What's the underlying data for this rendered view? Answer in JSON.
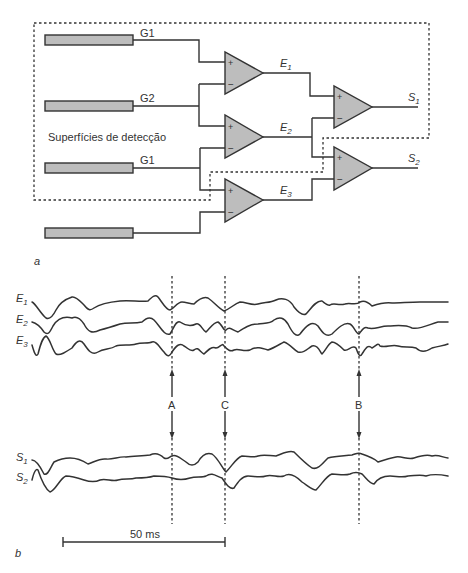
{
  "panel_a": {
    "label": "a",
    "box_label": "Superfícies de detecção",
    "electrodes": [
      {
        "label": "G1"
      },
      {
        "label": "G2"
      },
      {
        "label": "G1"
      },
      {
        "label": ""
      }
    ],
    "amplifiers": [
      {
        "output": "E",
        "sub": "1",
        "plus": "+",
        "minus": "−"
      },
      {
        "output": "E",
        "sub": "2",
        "plus": "+",
        "minus": "−"
      },
      {
        "output": "E",
        "sub": "3",
        "plus": "+",
        "minus": "−"
      },
      {
        "output": "S",
        "sub": "1",
        "plus": "+",
        "minus": "−"
      },
      {
        "output": "S",
        "sub": "2",
        "plus": "+",
        "minus": "−"
      }
    ],
    "colors": {
      "fill": "#bdbdbd",
      "stroke": "#333333"
    }
  },
  "panel_b": {
    "label": "b",
    "traces_top": [
      {
        "name": "E",
        "sub": "1"
      },
      {
        "name": "E",
        "sub": "2"
      },
      {
        "name": "E",
        "sub": "3"
      }
    ],
    "traces_bottom": [
      {
        "name": "S",
        "sub": "1"
      },
      {
        "name": "S",
        "sub": "2"
      }
    ],
    "markers": [
      {
        "label": "A"
      },
      {
        "label": "C"
      },
      {
        "label": "B"
      }
    ],
    "scale_bar": {
      "label": "50 ms"
    }
  }
}
